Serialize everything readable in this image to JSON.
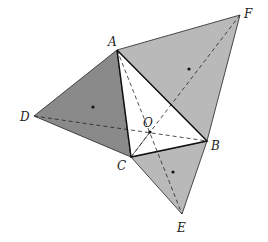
{
  "diagram": {
    "points": {
      "A": {
        "label": "A",
        "x": 117,
        "y": 50,
        "lx": 108,
        "ly": 46
      },
      "B": {
        "label": "B",
        "x": 207,
        "y": 141,
        "lx": 211,
        "ly": 150
      },
      "C": {
        "label": "C",
        "x": 131,
        "y": 157,
        "lx": 117,
        "ly": 170
      },
      "D": {
        "label": "D",
        "x": 34,
        "y": 116,
        "lx": 20,
        "ly": 121
      },
      "E": {
        "label": "E",
        "x": 182,
        "y": 214,
        "lx": 177,
        "ly": 232
      },
      "F": {
        "label": "F",
        "x": 240,
        "y": 15,
        "lx": 244,
        "ly": 18
      },
      "O": {
        "label": "O",
        "x": 150,
        "y": 132,
        "lx": 143,
        "ly": 127
      }
    },
    "colors": {
      "dark_fill": "#8a8a8a",
      "light_fill": "#b9b9b9",
      "inner_fill": "#ffffff",
      "stroke": "#222222"
    }
  }
}
